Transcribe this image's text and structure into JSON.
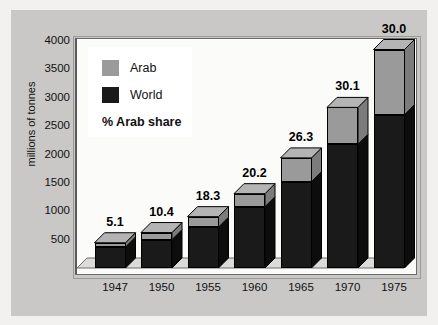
{
  "chart_data": {
    "type": "bar",
    "title": "",
    "subtitle": "",
    "xlabel": "",
    "ylabel": "millions of tonnes",
    "categories": [
      "1947",
      "1950",
      "1955",
      "1960",
      "1965",
      "1970",
      "1975"
    ],
    "ylim": [
      0,
      4000
    ],
    "yticks": [
      500,
      1000,
      1500,
      2000,
      2500,
      3000,
      3500,
      4000
    ],
    "grid": false,
    "legend_position": "top-left",
    "style": "3d-stacked-bar",
    "series": [
      {
        "name": "World",
        "values": [
          370,
          500,
          720,
          1080,
          1520,
          2180,
          2700
        ]
      },
      {
        "name": "Arab",
        "values": [
          75,
          125,
          185,
          230,
          420,
          650,
          1150
        ]
      }
    ],
    "totals": [
      445,
      625,
      905,
      1310,
      1940,
      2830,
      3850
    ],
    "annotations": [
      "5.1",
      "10.4",
      "18.3",
      "20.2",
      "26.3",
      "30.1",
      "30.0"
    ],
    "annotation_label": "% Arab share"
  },
  "legend": {
    "arab_label": "Arab",
    "world_label": "World",
    "note": "% Arab share"
  },
  "colors": {
    "arab": "#9a9a9a",
    "arab_top": "#b4b4b4",
    "arab_side": "#7c7c7c",
    "world": "#1a1a1a",
    "world_top": "#333333",
    "world_side": "#0d0d0d",
    "panel": "#c9c8c6",
    "plot": "#fbfbfa",
    "axis": "#5a5a5a"
  }
}
